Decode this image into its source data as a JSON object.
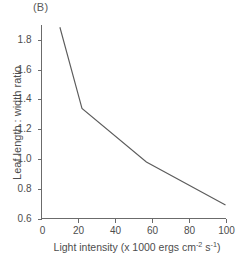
{
  "figure": {
    "panel_label": "(B)",
    "background_color": "#ffffff",
    "line_color": "#5c5c5c",
    "axis_color": "#6b6b6b",
    "text_color": "#4d4d4d"
  },
  "chart_data": {
    "type": "line",
    "title": "",
    "panel": "(B)",
    "xlabel_parts": {
      "prefix": "Light intensity (x 1000 ergs cm",
      "sup1": "-2",
      "middle": " s",
      "sup2": "-1",
      "suffix": ")"
    },
    "xlabel": "Light intensity (x 1000 ergs cm-2 s-1)",
    "ylabel": "Leaf length : width ratio",
    "xlim": [
      0,
      100
    ],
    "ylim": [
      0.6,
      1.9
    ],
    "xticks": [
      0,
      20,
      40,
      60,
      80,
      100
    ],
    "xtick_labels": [
      "0",
      "20",
      "40",
      "60",
      "80",
      "100"
    ],
    "yticks": [
      0.6,
      0.8,
      1.0,
      1.2,
      1.4,
      1.6,
      1.8
    ],
    "ytick_labels": [
      "0.6",
      "0.8",
      "1.0",
      "1.2",
      "1.4",
      "1.6",
      "1.8"
    ],
    "grid": false,
    "legend": null,
    "markers": false,
    "series": [
      {
        "name": "Leaf length : width ratio",
        "x": [
          10,
          22,
          57,
          100
        ],
        "y": [
          1.885,
          1.34,
          0.98,
          0.69
        ]
      }
    ]
  }
}
